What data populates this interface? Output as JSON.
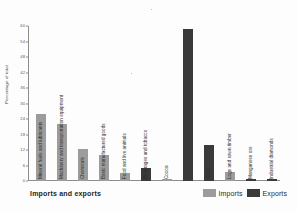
{
  "chart_data": {
    "type": "bar",
    "title": "",
    "xlabel": "Imports and exports",
    "ylabel": "Percentage of total",
    "ylim": [
      0,
      60
    ],
    "yticks": [
      0,
      6,
      12,
      18,
      24,
      30,
      36,
      42,
      48,
      54,
      60
    ],
    "grid": false,
    "legend_position": "bottom-right",
    "categories": [
      "Mineral fuels and lubricants",
      "Machinery and transportation equipment",
      "Chemicals",
      "Basic manufactured goods",
      "Food and live animals",
      "Beverages and tobacco",
      "Cocoa",
      "Gold",
      "Logs and sawn timber",
      "Manganese ore",
      "Industrial diamonds"
    ],
    "bars": [
      {
        "label": "Mineral fuels and lubricants",
        "series": "Imports",
        "value": 26.0
      },
      {
        "label": "Machinery and transportation equipment",
        "series": "Imports",
        "value": 22.0
      },
      {
        "label": "Chemicals",
        "series": "Imports",
        "value": 12.2
      },
      {
        "label": "Basic manufactured goods",
        "series": "Imports",
        "value": 10.0
      },
      {
        "label": "Food and live animals",
        "series": "Imports",
        "value": 3.2
      },
      {
        "label": "Beverages and tobacco",
        "series": "Exports",
        "value": 5.2
      },
      {
        "label": "Cocoa",
        "series": "Imports",
        "value": 0.7
      },
      {
        "label": "Cocoa",
        "series": "Exports",
        "value": 59.0
      },
      {
        "label": "Gold",
        "series": "Exports",
        "value": 14.0
      },
      {
        "label": "Logs and sawn timber",
        "series": "Imports",
        "value": 3.3
      },
      {
        "label": "Manganese ore",
        "series": "Exports",
        "value": 0.9
      },
      {
        "label": "Industrial diamonds",
        "series": "Exports",
        "value": 0.6
      }
    ],
    "legend": [
      {
        "name": "Imports",
        "color": "#9c9c9c"
      },
      {
        "name": "Exports",
        "color": "#3a3a3a"
      }
    ]
  },
  "colors": {
    "imports": "#9c9c9c",
    "exports": "#3a3a3a",
    "axis": "#8d8d8d",
    "background": "#fdfdfd",
    "text": "#2b2b2b"
  }
}
